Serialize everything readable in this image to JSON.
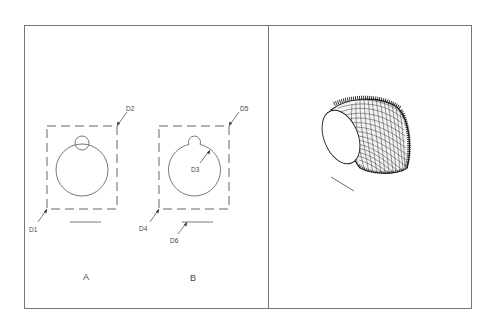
{
  "figure": {
    "type": "patent-drawing",
    "colors": {
      "line": "#555555",
      "frame": "#777777",
      "mesh": "#222222",
      "background": "#ffffff"
    },
    "left_panel": {
      "views": [
        {
          "caption": "A",
          "labels": {
            "top_right": "D2",
            "bottom_left": "D1"
          }
        },
        {
          "caption": "B",
          "labels": {
            "top_right": "D5",
            "bottom_left": "D4",
            "inner": "D3",
            "below_line": "D6"
          }
        }
      ]
    },
    "right_panel": {
      "description": "3D wireframe mesh of curved tubular surface with elliptical opening"
    }
  }
}
